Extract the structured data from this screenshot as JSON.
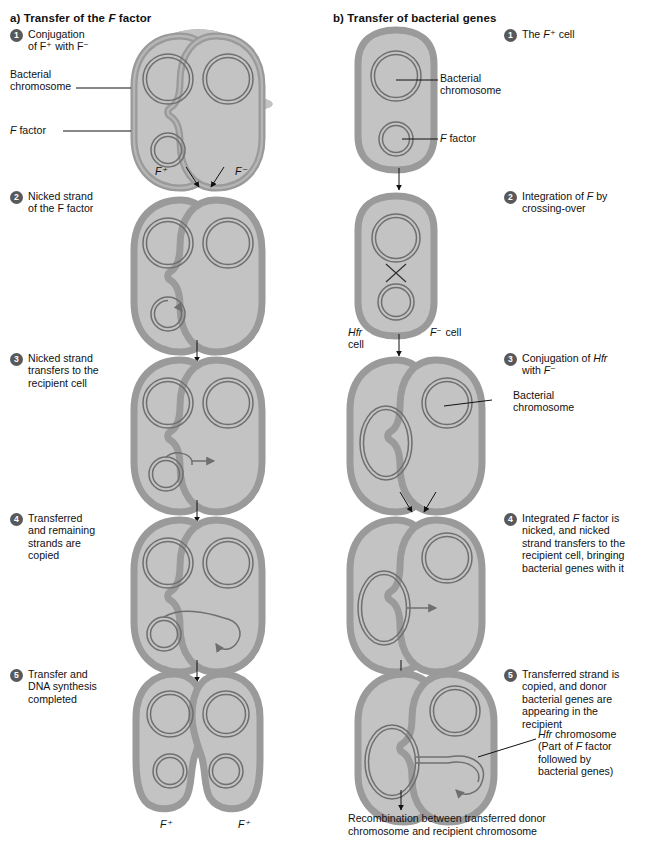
{
  "figure": {
    "panel_a": {
      "title_prefix": "a)",
      "title_main": "Transfer of the ",
      "title_italic": "F",
      "title_suffix": " factor",
      "steps": [
        {
          "num": "1",
          "text": "Conjugation\nof F⁺ with F⁻"
        },
        {
          "num": "2",
          "text": "Nicked strand\nof the F factor"
        },
        {
          "num": "3",
          "text": "Nicked strand\ntransfers to the\nrecipient cell"
        },
        {
          "num": "4",
          "text": "Transferred\nand remaining\nstrands are\ncopied"
        },
        {
          "num": "5",
          "text": "Transfer and\nDNA synthesis\ncompleted"
        }
      ],
      "callouts": [
        {
          "name": "bacterial-chromosome",
          "text": "Bacterial\nchromosome"
        },
        {
          "name": "f-factor",
          "text": "F factor"
        }
      ],
      "cell_labels": {
        "donor_top": "F⁺",
        "recipient_top": "F⁻",
        "result_left": "F⁺",
        "result_right": "F⁺"
      }
    },
    "panel_b": {
      "title_prefix": "b)",
      "title_main": "Transfer of bacterial genes",
      "steps": [
        {
          "num": "1",
          "text": "The F⁺ cell"
        },
        {
          "num": "2",
          "text": "Integration of F by\ncrossing-over"
        },
        {
          "num": "3",
          "text": "Conjugation of Hfr\nwith F⁻"
        },
        {
          "num": "4",
          "text": "Integrated F factor is\nnicked, and nicked\nstrand transfers to the\nrecipient cell, bringing\nbacterial genes with it"
        },
        {
          "num": "5",
          "text": "Transferred strand is\ncopied, and donor\nbacterial genes are\nappearing in the\nrecipient"
        }
      ],
      "callouts": [
        {
          "name": "bacterial-chromosome-1",
          "text": "Bacterial\nchromosome"
        },
        {
          "name": "f-factor",
          "text": "F factor"
        },
        {
          "name": "bacterial-chromosome-2",
          "text": "Bacterial\nchromosome"
        },
        {
          "name": "hfr-chromosome",
          "text": "Hfr chromosome\n(Part of F factor\nfollowed by\nbacterial genes)"
        }
      ],
      "cell_labels": {
        "hfr_cell": "Hfr\ncell",
        "f_minus_cell": "F⁻ cell"
      },
      "bottom_caption": "Recombination between transferred donor\nchromosome and recipient chromosome"
    },
    "colors": {
      "cytoplasm": "#c3c3c3",
      "membrane": "#9a9a9a",
      "membrane_dark": "#8c8c8c",
      "dna_stroke": "#6f6f6f",
      "badge": "#58595b",
      "text": "#111111",
      "background": "#ffffff"
    }
  }
}
